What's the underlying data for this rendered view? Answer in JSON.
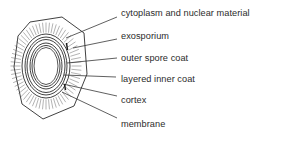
{
  "figure": {
    "background_color": "#ffffff",
    "line_color": "#2b2b2b",
    "text_color": "#2b2b2b",
    "hatch_color": "#555555",
    "core_fill": "#ffffff"
  },
  "labels": [
    {
      "id": "cytoplasm-and-nuclear-material",
      "text": "cytoplasm and nuclear material",
      "x": 121,
      "y": 8,
      "leader": {
        "x1": 117,
        "y1": 17,
        "x2": 66,
        "y2": 38
      }
    },
    {
      "id": "exosporium",
      "text": "exosporium",
      "x": 121,
      "y": 31,
      "leader": {
        "x1": 117,
        "y1": 39,
        "x2": 73,
        "y2": 48
      }
    },
    {
      "id": "outer-spore-coat",
      "text": "outer spore coat",
      "x": 121,
      "y": 53,
      "leader": {
        "x1": 117,
        "y1": 58,
        "x2": 67,
        "y2": 63
      }
    },
    {
      "id": "layered-inner-coat",
      "text": "layered inner coat",
      "x": 121,
      "y": 74,
      "leader": {
        "x1": 116,
        "y1": 77,
        "x2": 64,
        "y2": 75
      }
    },
    {
      "id": "cortex",
      "text": "cortex",
      "x": 121,
      "y": 95,
      "leader": {
        "x1": 117,
        "y1": 96,
        "x2": 63,
        "y2": 84
      }
    },
    {
      "id": "membrane",
      "text": "membrane",
      "x": 121,
      "y": 119,
      "leader": {
        "x1": 117,
        "y1": 118,
        "x2": 62,
        "y2": 92
      }
    }
  ],
  "diagram": {
    "outer_shell_name": "exosporium-outline",
    "rings": [
      {
        "id": "outer-spore-coat-ring",
        "rx": 24,
        "ry": 32
      },
      {
        "id": "layered-inner-coat-ring-a",
        "rx": 21,
        "ry": 29
      },
      {
        "id": "layered-inner-coat-ring-b",
        "rx": 19,
        "ry": 26.5
      },
      {
        "id": "cortex-ring",
        "rx": 16,
        "ry": 23
      },
      {
        "id": "membrane-ring",
        "rx": 14,
        "ry": 20.5
      }
    ],
    "core": {
      "id": "cytoplasm-core",
      "rx": 12,
      "ry": 18.5
    },
    "center": {
      "cx": 46,
      "cy": 66
    },
    "hatch_count": 64
  }
}
